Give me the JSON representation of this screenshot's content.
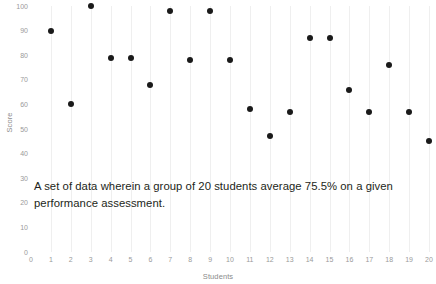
{
  "chart_data": {
    "type": "scatter",
    "title": "",
    "xlabel": "Students",
    "ylabel": "Score",
    "xlim": [
      0,
      20
    ],
    "ylim": [
      0,
      100
    ],
    "grid": "vertical-only",
    "legend": "none",
    "x_ticks": [
      "0",
      "1",
      "2",
      "3",
      "4",
      "5",
      "6",
      "7",
      "8",
      "9",
      "10",
      "11",
      "12",
      "13",
      "14",
      "15",
      "16",
      "17",
      "18",
      "19",
      "20"
    ],
    "y_ticks": [
      "0",
      "10",
      "20",
      "30",
      "40",
      "50",
      "60",
      "70",
      "80",
      "90",
      "100"
    ],
    "series": [
      {
        "name": "Score",
        "marker": "circle",
        "color": "#1a1a1a",
        "x": [
          1,
          2,
          3,
          4,
          5,
          6,
          7,
          8,
          9,
          10,
          11,
          12,
          13,
          14,
          15,
          16,
          17,
          18,
          19,
          20
        ],
        "values": [
          90,
          60,
          100,
          79,
          79,
          68,
          98,
          78,
          98,
          78,
          58,
          47,
          57,
          87,
          87,
          66,
          57,
          76,
          57,
          45
        ]
      }
    ]
  },
  "annotation": {
    "line1": "A set of data wherein a group of 20 students average 75.5% on a given",
    "line2": "performance assessment."
  },
  "colors": {
    "marker": "#1a1a1a",
    "gridline": "#efefef",
    "tick_label": "#9a9a9a",
    "axis_title": "#8b8b8b",
    "caption_text": "#231f20",
    "background": "#ffffff"
  }
}
